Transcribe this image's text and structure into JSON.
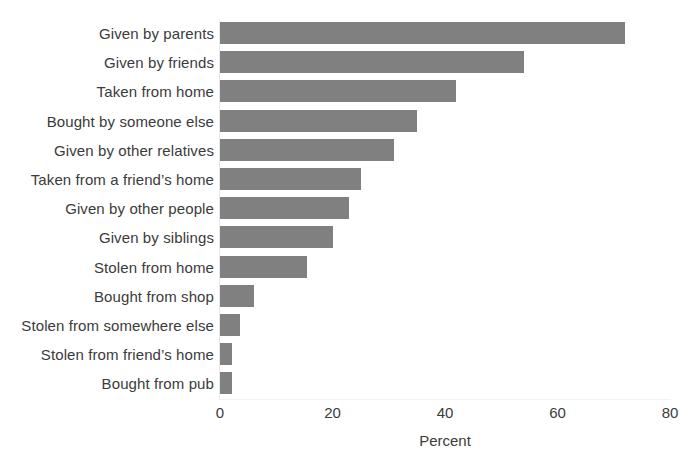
{
  "chart_data": {
    "type": "bar",
    "orientation": "horizontal",
    "title": "",
    "subtitle": "",
    "xlabel": "Percent",
    "ylabel": "",
    "xlim": [
      0,
      80
    ],
    "xticks": [
      0,
      20,
      40,
      60,
      80
    ],
    "xtick_labels": [
      "0",
      "20",
      "40",
      "60",
      "80"
    ],
    "grid": false,
    "legend": false,
    "legend_position": "none",
    "bar_color": "#808080",
    "text_color": "#3b3b3b",
    "background_color": "#ffffff",
    "categories": [
      "Given by parents",
      "Given by friends",
      "Taken from home",
      "Bought by someone else",
      "Given by other relatives",
      "Taken from a friend’s home",
      "Given by other people",
      "Given by siblings",
      "Stolen from home",
      "Bought from shop",
      "Stolen from somewhere else",
      "Stolen from friend’s home",
      "Bought from pub"
    ],
    "values": [
      72,
      54,
      42,
      35,
      31,
      25,
      23,
      20,
      15.5,
      6,
      3.5,
      2.2,
      2.2
    ]
  }
}
